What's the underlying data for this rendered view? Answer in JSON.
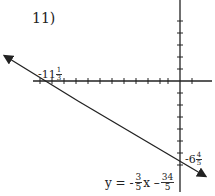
{
  "problem_number": "11)",
  "x_intercept": {
    "whole": "-11",
    "num": "1",
    "den": "3"
  },
  "y_intercept": {
    "whole": "-6",
    "num": "4",
    "den": "5"
  },
  "equation": {
    "lhs": "y = -",
    "slope_num": "3",
    "slope_den": "5",
    "var": "x –",
    "const_num": "34",
    "const_den": "5"
  }
}
